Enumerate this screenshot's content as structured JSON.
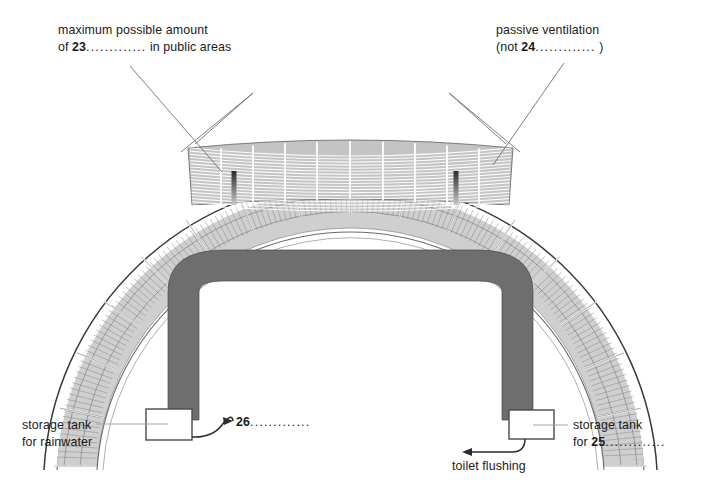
{
  "diagram": {
    "colors": {
      "track_gray": "#6e6e6e",
      "seating_gray": "#b9b9b9",
      "line_dark": "#3a3a3a",
      "line_light": "#8c8c8c",
      "text": "#1a1a1a",
      "background": "#ffffff"
    },
    "labels": {
      "amount_line1": "maximum possible amount",
      "amount_line2_prefix": "of ",
      "amount_number": "23",
      "amount_dots": ".............",
      "amount_line2_suffix": " in public areas",
      "ventilation_line1": "passive ventilation",
      "ventilation_line2_prefix": "(not ",
      "ventilation_number": "24",
      "ventilation_dots": ".............",
      "ventilation_line2_suffix": " )",
      "rainwater_line1": "storage tank",
      "rainwater_line2": "for rainwater",
      "tank25_line1": "storage tank",
      "tank25_line2_prefix": "for ",
      "tank25_number": "25",
      "tank25_dots": ".............",
      "output26_number": "26",
      "output26_dots": ".............",
      "toilet_flushing": "toilet flushing"
    }
  }
}
